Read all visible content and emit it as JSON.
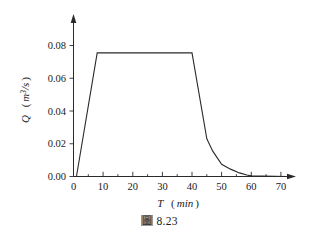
{
  "figure": {
    "caption_mark": "圖",
    "caption_number": "8.23",
    "background_color": "#ffffff",
    "line_color": "#2a2a2a"
  },
  "chart_data": {
    "type": "line",
    "title": "",
    "xlabel": "T ( min )",
    "xlabel_symbol": "T",
    "xlabel_unit": "( min )",
    "ylabel": "Q ( m3/s )",
    "ylabel_symbol": "Q",
    "ylabel_unit": "( m3/s )",
    "xlim": [
      0,
      73
    ],
    "ylim": [
      0,
      0.0855
    ],
    "xticks": [
      0,
      10,
      20,
      30,
      40,
      50,
      60,
      70
    ],
    "xtick_labels": [
      "0",
      "10",
      "20",
      "30",
      "40",
      "50",
      "60",
      "70"
    ],
    "xminor_ticks": [
      5,
      15,
      25,
      35,
      45,
      55,
      65
    ],
    "yticks": [
      0.0,
      0.02,
      0.04,
      0.06,
      0.08
    ],
    "ytick_labels": [
      "0.00",
      "0.02",
      "0.04",
      "0.06",
      "0.08"
    ],
    "grid": false,
    "legend": null,
    "series": [
      {
        "name": "Q",
        "x": [
          0,
          1,
          8,
          40,
          45,
          47,
          50,
          53,
          56,
          58.5,
          60,
          72
        ],
        "y": [
          0.0,
          0.0,
          0.0755,
          0.0755,
          0.023,
          0.0155,
          0.0075,
          0.0045,
          0.0022,
          0.0009,
          0.0004,
          0.0
        ]
      }
    ],
    "annotations": {
      "plateau_value": 0.0755,
      "plateau_start_min": 8,
      "plateau_end_min": 40,
      "ramp_up_start_min": 0,
      "tail_end_min": 60
    }
  }
}
